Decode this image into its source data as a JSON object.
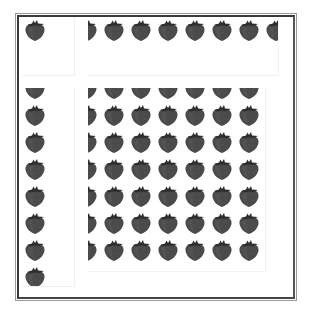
{
  "image": {
    "description": "Tiled strawberry texture rendered in four panels inside a double-line frame",
    "subject": "strawberry",
    "colors": {
      "berry_body": "#4a4a4a",
      "berry_shade": "#3a3a3a",
      "leaf": "#2e2e2e",
      "frame": "#3a3a3a",
      "background": "#ffffff"
    },
    "tile_spacing_px": 27,
    "panels": [
      {
        "id": "top-left",
        "rows": 1,
        "cols": 1
      },
      {
        "id": "top-right",
        "rows": 1,
        "cols": 8
      },
      {
        "id": "bottom-left",
        "rows": 8,
        "cols": 1
      },
      {
        "id": "bottom-right",
        "rows": 7,
        "cols": 7
      }
    ]
  }
}
